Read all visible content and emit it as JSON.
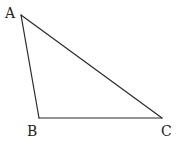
{
  "diagram": {
    "type": "triangle",
    "name": "ABC",
    "vertices": [
      {
        "label": "A",
        "x": 21,
        "y": 15,
        "label_x": 5,
        "label_y": 18
      },
      {
        "label": "B",
        "x": 39,
        "y": 118,
        "label_x": 27,
        "label_y": 136
      },
      {
        "label": "C",
        "x": 162,
        "y": 118,
        "label_x": 161,
        "label_y": 136
      }
    ],
    "edges": [
      {
        "from": "A",
        "to": "B"
      },
      {
        "from": "B",
        "to": "C"
      },
      {
        "from": "A",
        "to": "C"
      }
    ],
    "line_color": "#2a2a2a",
    "label_color": "#222222",
    "background": "#ffffff"
  }
}
